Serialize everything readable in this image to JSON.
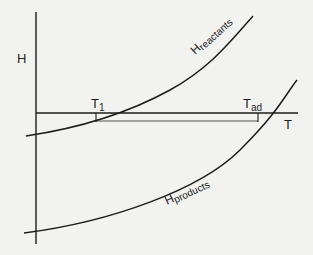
{
  "diagram": {
    "type": "enthalpy-temperature diagram",
    "axes": {
      "y_label": "H",
      "x_label": "T"
    },
    "curves": [
      {
        "name": "reactants",
        "label_main": "H",
        "label_sub": "reactants"
      },
      {
        "name": "products",
        "label_main": "H",
        "label_sub": "products"
      }
    ],
    "markers": [
      {
        "name": "T1",
        "label_main": "T",
        "label_sub": "1"
      },
      {
        "name": "Tad",
        "label_main": "T",
        "label_sub": "ad"
      }
    ],
    "colors": {
      "background": "#f2f2f0",
      "ink": "#1c1c1c",
      "secondary_line": "#555555"
    }
  }
}
